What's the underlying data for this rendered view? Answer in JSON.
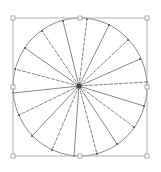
{
  "drawing": {
    "canvas": {
      "width": 161,
      "height": 172,
      "background": "#ffffff"
    },
    "selection_box": {
      "x": 13,
      "y": 18,
      "width": 134,
      "height": 138,
      "stroke": "#b0b0b0",
      "handle_fill": "#ffffff",
      "handle_stroke": "#999999",
      "handles": [
        {
          "name": "top-left",
          "x": 13,
          "y": 18
        },
        {
          "name": "top-middle",
          "x": 80,
          "y": 18
        },
        {
          "name": "top-right",
          "x": 147,
          "y": 18
        },
        {
          "name": "middle-left",
          "x": 13,
          "y": 87
        },
        {
          "name": "middle-right",
          "x": 147,
          "y": 87
        },
        {
          "name": "bottom-left",
          "x": 13,
          "y": 156
        },
        {
          "name": "bottom-middle",
          "x": 80,
          "y": 156
        },
        {
          "name": "bottom-right",
          "x": 147,
          "y": 156
        }
      ]
    },
    "circle": {
      "cx": 80,
      "cy": 87,
      "rx": 67,
      "ry": 69,
      "stroke": "#8a8a8a"
    },
    "center": {
      "x": 79,
      "y": 86,
      "color": "#444444"
    },
    "spoke_color": "#7a7a7a",
    "endpoint_color": "#555555",
    "spokes": [
      {
        "x": 63,
        "y": 21
      },
      {
        "x": 87,
        "y": 19
      },
      {
        "x": 109,
        "y": 25
      },
      {
        "x": 128,
        "y": 40
      },
      {
        "x": 140,
        "y": 59
      },
      {
        "x": 147,
        "y": 82
      },
      {
        "x": 144,
        "y": 106
      },
      {
        "x": 134,
        "y": 127
      },
      {
        "x": 117,
        "y": 144
      },
      {
        "x": 97,
        "y": 154
      },
      {
        "x": 74,
        "y": 156
      },
      {
        "x": 52,
        "y": 150
      },
      {
        "x": 32,
        "y": 136
      },
      {
        "x": 19,
        "y": 115
      },
      {
        "x": 13,
        "y": 93
      },
      {
        "x": 15,
        "y": 69
      },
      {
        "x": 25,
        "y": 48
      },
      {
        "x": 42,
        "y": 31
      }
    ]
  }
}
